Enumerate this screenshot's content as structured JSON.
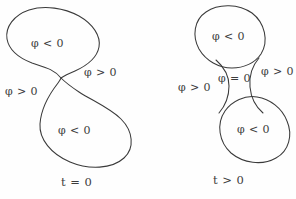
{
  "figure": {
    "stroke_color": "#3a3a3a",
    "background_color": "#fefefe",
    "text_color": "#3c3c3c",
    "phi_symbol": "φ"
  },
  "panels": [
    {
      "id": "left",
      "name": "figure-eight-panel",
      "caption": "t = 0",
      "caption_variable": "t",
      "caption_relation": "=",
      "caption_value": "0",
      "description": "Self-intersecting figure-eight (lemniscate) curve",
      "labels": [
        {
          "id": "upper-inside",
          "text": "φ < 0",
          "region": "inside-upper-lobe",
          "sign": "negative"
        },
        {
          "id": "left-outside",
          "text": "φ > 0",
          "region": "outside-left",
          "sign": "positive"
        },
        {
          "id": "right-outside",
          "text": "φ > 0",
          "region": "outside-right",
          "sign": "positive"
        },
        {
          "id": "lower-inside",
          "text": "φ < 0",
          "region": "inside-lower-lobe",
          "sign": "negative"
        }
      ]
    },
    {
      "id": "right",
      "name": "split-curves-panel",
      "caption": "t > 0",
      "caption_variable": "t",
      "caption_relation": ">",
      "caption_value": "0",
      "description": "Two disjoint closed curves after the figure-eight pinches apart",
      "labels": [
        {
          "id": "upper-inside",
          "text": "φ < 0",
          "region": "inside-upper-circle",
          "sign": "negative"
        },
        {
          "id": "neck-zero",
          "text": "φ = 0",
          "region": "neck-between-circles",
          "sign": "zero"
        },
        {
          "id": "left-outside",
          "text": "φ > 0",
          "region": "outside-left",
          "sign": "positive"
        },
        {
          "id": "right-outside",
          "text": "φ > 0",
          "region": "outside-right",
          "sign": "positive"
        },
        {
          "id": "lower-inside",
          "text": "φ < 0",
          "region": "inside-lower-circle",
          "sign": "negative"
        }
      ]
    }
  ],
  "geometry": {
    "figure_eight_path": "M 60.5 78.5 C 52 66 28 64 14 52 C 2 41 6 22 20 12 C 36 1 62 4 79 14 C 95 23 103 36 99 48 C 95 61 74 68 64 76 C 56 83 58 91 66 99 C 78 111 101 108 117 118 C 133 128 138 146 128 157 C 116 169 88 169 70 160 C 52 151 41 136 43 122 C 45 106 57 92 60.5 78.5 Z",
    "upper_circle_path": "M 232 66 C 219 63 207 55 201 44 C 194 31 197 17 209 11 C 222 4 241 6 252 15 C 264 25 266 42 258 54 C 252 62 242 67 232 66 Z",
    "lower_circle_path": "M 243 100 C 255 96 269 99 278 108 C 289 119 291 137 284 150 C 276 162 258 166 245 160 C 231 153 223 138 225 123 C 226 112 234 103 243 100 Z",
    "neck_left_path": "M 217 61 C 225 66 230 75 230 86 C 230 96 225 105 217 110",
    "neck_right_path": "M 256 57 C 250 65 247 76 248 87 C 249 98 253 108 259 115"
  }
}
